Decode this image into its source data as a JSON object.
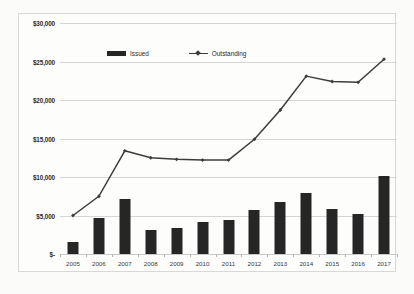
{
  "chart_data": {
    "type": "bar",
    "title": "",
    "xlabel": "",
    "ylabel": "",
    "categories": [
      "2005",
      "2006",
      "2007",
      "2008",
      "2009",
      "2010",
      "2011",
      "2012",
      "2013",
      "2014",
      "2015",
      "2016",
      "2017"
    ],
    "series": [
      {
        "name": "Issued",
        "type": "bar",
        "color": "#262626",
        "values": [
          1500,
          4700,
          7100,
          3100,
          3400,
          4200,
          4400,
          5700,
          6800,
          7900,
          5800,
          5200,
          10100
        ]
      },
      {
        "name": "Outstanding",
        "type": "line",
        "color": "#3c3c3c",
        "values": [
          5000,
          7500,
          13400,
          12500,
          12300,
          12200,
          12200,
          14900,
          18700,
          23100,
          22400,
          22300,
          25300
        ]
      }
    ],
    "ylim": [
      0,
      30000
    ],
    "ytick_values": [
      0,
      5000,
      10000,
      15000,
      20000,
      25000,
      30000
    ],
    "ytick_labels": [
      "$-",
      "$5,000",
      "$10,000",
      "$15,000",
      "$20,000",
      "$25,000",
      "$30,000"
    ],
    "grid": true,
    "legend_position": "top-center",
    "legend": [
      {
        "label": "Issued",
        "marker": "bar-swatch"
      },
      {
        "label": "Outstanding",
        "marker": "line-diamond-swatch"
      }
    ]
  }
}
